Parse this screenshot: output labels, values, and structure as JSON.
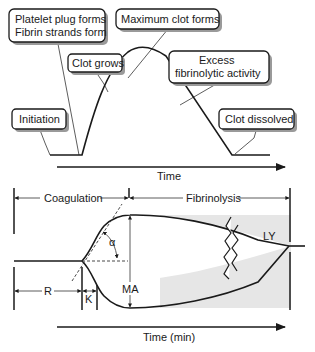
{
  "top_panel": {
    "title": "Hemostasis phases over time",
    "callouts": [
      {
        "id": "platelet",
        "lines": [
          "Platelet plug forms",
          "Fibrin strands form"
        ]
      },
      {
        "id": "max",
        "lines": [
          "Maximum clot forms"
        ]
      },
      {
        "id": "grows",
        "lines": [
          "Clot grows"
        ]
      },
      {
        "id": "excess",
        "lines": [
          "Excess",
          "fibrinolytic activity"
        ]
      },
      {
        "id": "initiation",
        "lines": [
          "Initiation"
        ]
      },
      {
        "id": "dissolved",
        "lines": [
          "Clot dissolved"
        ]
      }
    ],
    "x_axis_label": "Time"
  },
  "bottom_panel": {
    "title": "Thromboelastography tracing",
    "phases": {
      "coagulation": "Coagulation",
      "fibrinolysis": "Fibrinolysis"
    },
    "parameters": {
      "r": "R",
      "k": "K",
      "alpha": "α",
      "ma": "MA",
      "ly": "LY"
    },
    "x_axis_label": "Time (min)",
    "shade_color": "#e6e6e6"
  }
}
